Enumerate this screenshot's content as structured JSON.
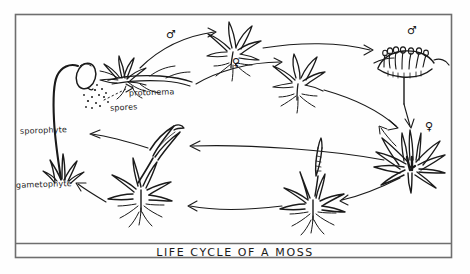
{
  "figure": {
    "title": "LIFE  CYCLE  OF  A  MOSS",
    "caption_band": true,
    "style": "hand-drawn pen-and-ink botanical diagram, black ink on off-white paper",
    "frame": {
      "color": "#6e6e6e",
      "x": 15,
      "y": 14,
      "width": 437,
      "height": 244,
      "caption_divider_y": 243
    }
  },
  "labels": {
    "spores": "spores",
    "sporophyte": "sporophyte",
    "gametophyte": "gametophyte",
    "protonema": "protonema"
  },
  "symbols": {
    "male": "♂",
    "female": "♀",
    "male_name": "male-symbol",
    "female_name": "female-symbol"
  },
  "symbol_positions": [
    {
      "name": "male-symbol-protonema-branch",
      "glyph": "♂",
      "x": 168,
      "y": 33
    },
    {
      "name": "female-symbol-protonema-branch",
      "glyph": "♀",
      "x": 234,
      "y": 61
    },
    {
      "name": "male-symbol-antheridial-head",
      "glyph": "♂",
      "x": 410,
      "y": 30
    },
    {
      "name": "female-symbol-archegonial-head",
      "glyph": "♀",
      "x": 428,
      "y": 126
    }
  ],
  "stages": [
    {
      "name": "spore-capsule-sporophyte",
      "label": "sporophyte",
      "position": "left",
      "description": "curved seta with oval capsule releasing spores"
    },
    {
      "name": "spore-cluster",
      "label": "spores",
      "position": "left-upper",
      "description": "scattered dots"
    },
    {
      "name": "protonema-filaments",
      "label": "protonema",
      "position": "top-left",
      "description": "threadlike green filaments with young leafy bud"
    },
    {
      "name": "young-gametophyte-male",
      "label": "",
      "position": "top-center",
      "description": "small leafy shoot male"
    },
    {
      "name": "young-gametophyte-female",
      "label": "",
      "position": "top-center-right",
      "description": "small leafy shoot female"
    },
    {
      "name": "antheridial-head",
      "label": "",
      "position": "top-right",
      "description": "splash cup with antheridia, male"
    },
    {
      "name": "archegonial-head",
      "label": "",
      "position": "right",
      "description": "archegonial cluster, female"
    },
    {
      "name": "fertilized-gametophyte",
      "label": "",
      "position": "bottom-right",
      "description": "leafy shoot with developing sporophyte"
    },
    {
      "name": "sporophyte-on-gametophyte",
      "label": "",
      "position": "bottom-center",
      "description": "young sporophyte capsule on leafy gametophyte"
    },
    {
      "name": "mature-gametophyte",
      "label": "gametophyte",
      "position": "bottom-left",
      "description": "leafy shoot with rhizoids"
    }
  ],
  "colors": {
    "ink": "#1a1a1a",
    "frame": "#6e6e6e",
    "paper": "#fefefe",
    "arrow": "#222222"
  }
}
